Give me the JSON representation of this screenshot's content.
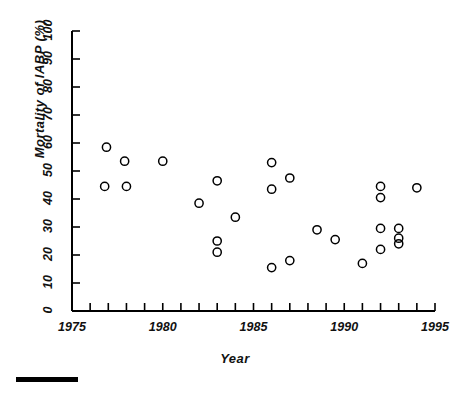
{
  "chart_data": {
    "type": "scatter",
    "title": "",
    "xlabel": "Year",
    "ylabel": "Mortality of IABP (%)",
    "xlim": [
      1975,
      1995
    ],
    "ylim": [
      0,
      100
    ],
    "xticks": [
      1975,
      1976,
      1977,
      1978,
      1979,
      1980,
      1981,
      1982,
      1983,
      1984,
      1985,
      1986,
      1987,
      1988,
      1989,
      1990,
      1991,
      1992,
      1993,
      1994,
      1995
    ],
    "xtick_labels": [
      "1975",
      "1980",
      "1985",
      "1990",
      "1995"
    ],
    "xtick_labels_values": [
      1975,
      1980,
      1985,
      1990,
      1995
    ],
    "yticks": [
      0,
      10,
      20,
      30,
      40,
      50,
      60,
      70,
      80,
      90,
      100
    ],
    "ytick_labels": [
      "0",
      "10",
      "20",
      "30",
      "40",
      "50",
      "60",
      "70",
      "80",
      "90",
      "100"
    ],
    "grid": false,
    "legend": null,
    "marker": "open-circle",
    "marker_color": "#000000",
    "points": [
      {
        "x": 1976.9,
        "y": 58.5
      },
      {
        "x": 1977.9,
        "y": 53.5
      },
      {
        "x": 1978.0,
        "y": 44.5
      },
      {
        "x": 1976.8,
        "y": 44.5
      },
      {
        "x": 1980.0,
        "y": 53.5
      },
      {
        "x": 1982.0,
        "y": 38.5
      },
      {
        "x": 1983.0,
        "y": 46.5
      },
      {
        "x": 1983.0,
        "y": 25.0
      },
      {
        "x": 1983.0,
        "y": 21.0
      },
      {
        "x": 1984.0,
        "y": 33.5
      },
      {
        "x": 1986.0,
        "y": 53.0
      },
      {
        "x": 1986.0,
        "y": 43.5
      },
      {
        "x": 1986.0,
        "y": 15.5
      },
      {
        "x": 1987.0,
        "y": 47.5
      },
      {
        "x": 1987.0,
        "y": 18.0
      },
      {
        "x": 1988.5,
        "y": 29.0
      },
      {
        "x": 1989.5,
        "y": 25.5
      },
      {
        "x": 1991.0,
        "y": 17.0
      },
      {
        "x": 1992.0,
        "y": 44.5
      },
      {
        "x": 1992.0,
        "y": 40.5
      },
      {
        "x": 1992.0,
        "y": 29.5
      },
      {
        "x": 1992.0,
        "y": 22.0
      },
      {
        "x": 1993.0,
        "y": 29.5
      },
      {
        "x": 1993.0,
        "y": 26.0
      },
      {
        "x": 1993.0,
        "y": 24.0
      },
      {
        "x": 1994.0,
        "y": 44.0
      }
    ]
  },
  "figure": {
    "scalebar_present": true
  }
}
